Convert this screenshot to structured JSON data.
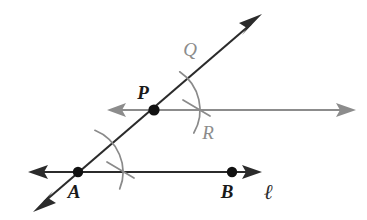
{
  "figure": {
    "kind": "geometry-construction-diagram",
    "background_color": "#ffffff",
    "width": 367,
    "height": 220
  },
  "colors": {
    "line_black": "#2b2b2b",
    "line_gray": "#8c8c8c",
    "arc_gray": "#8a8a8a",
    "point_fill": "#111111",
    "label_black": "#1a1a1a",
    "label_gray": "#8c8c8c"
  },
  "points": [
    {
      "id": "A",
      "label": "A",
      "x": 78,
      "y": 172,
      "label_x": 74,
      "label_y": 198,
      "color": "#111111",
      "radius": 5.2
    },
    {
      "id": "B",
      "label": "B",
      "x": 232,
      "y": 172,
      "label_x": 227,
      "label_y": 198,
      "color": "#111111",
      "radius": 5.2
    },
    {
      "id": "P",
      "label": "P",
      "x": 154,
      "y": 110,
      "label_x": 143,
      "label_y": 99,
      "color": "#111111",
      "radius": 5.6
    }
  ],
  "labels": [
    {
      "id": "Q",
      "text": "Q",
      "x": 190,
      "y": 56,
      "style": "gray-italic"
    },
    {
      "id": "R",
      "text": "R",
      "x": 208,
      "y": 139,
      "style": "gray-italic"
    },
    {
      "id": "ell",
      "text": "ℓ",
      "x": 266,
      "y": 198,
      "style": "black-italic-script"
    }
  ],
  "lines": [
    {
      "id": "line-l",
      "name": "line-l",
      "label": "ℓ",
      "color": "#2b2b2b",
      "stroke_width": 2.1,
      "x1": 33,
      "y1": 172,
      "x2": 258,
      "y2": 172,
      "arrow_start": true,
      "arrow_end": true,
      "through_points": [
        "A",
        "B"
      ]
    },
    {
      "id": "transversal",
      "name": "transversal-line",
      "color": "#2b2b2b",
      "stroke_width": 2.1,
      "x1": 38,
      "y1": 207,
      "x2": 257,
      "y2": 19,
      "arrow_start": true,
      "arrow_end": true,
      "through_points": [
        "A",
        "P"
      ]
    },
    {
      "id": "gray-ray",
      "name": "parallel-gray-line",
      "color": "#8c8c8c",
      "stroke_width": 2.1,
      "x1": 112,
      "y1": 110,
      "x2": 350,
      "y2": 110,
      "arrow_start": true,
      "arrow_end": true,
      "through_points": [
        "P"
      ]
    }
  ],
  "arcs": [
    {
      "id": "arc-at-A",
      "name": "compass-arc-at-A",
      "center_x": 78,
      "center_y": 172,
      "radius": 45,
      "start_angle_deg": -68,
      "end_angle_deg": 22,
      "color": "#8a8a8a",
      "stroke_width": 1.7
    },
    {
      "id": "arc-at-P",
      "name": "compass-arc-at-P",
      "center_x": 154,
      "center_y": 110,
      "radius": 46,
      "start_angle_deg": -56,
      "end_angle_deg": 30,
      "color": "#8a8a8a",
      "stroke_width": 1.7
    }
  ],
  "tick_marks": [
    {
      "id": "tick-at-A",
      "name": "compass-tick-at-A",
      "x1": 107,
      "y1": 162,
      "x2": 134,
      "y2": 178,
      "color": "#8a8a8a",
      "stroke_width": 1.7
    },
    {
      "id": "tick-at-P",
      "name": "compass-tick-at-P",
      "x1": 183,
      "y1": 100,
      "x2": 210,
      "y2": 116,
      "color": "#8a8a8a",
      "stroke_width": 1.7
    }
  ]
}
